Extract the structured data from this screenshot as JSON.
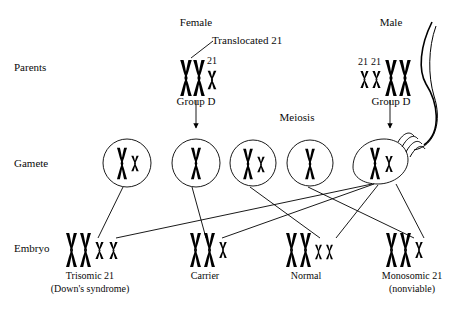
{
  "diagram": {
    "ink_color": "#000000",
    "background": "#ffffff",
    "row_labels": [
      {
        "name": "parents",
        "text": "Parents"
      },
      {
        "name": "gamete",
        "text": "Gamete"
      },
      {
        "name": "embryo",
        "text": "Embryo"
      }
    ],
    "parents": {
      "female": {
        "header": "Female",
        "annotation": "Translocated 21",
        "chromosome_21_label": "21",
        "group_label": "Group D",
        "chromosomes": [
          {
            "type": "large",
            "label": ""
          },
          {
            "type": "large",
            "label": ""
          },
          {
            "type": "small",
            "label": "21"
          }
        ]
      },
      "male": {
        "header": "Male",
        "chromosome_21_labels": [
          "21",
          "21"
        ],
        "group_label": "Group D",
        "chromosomes": [
          {
            "type": "small",
            "label": "21"
          },
          {
            "type": "small",
            "label": "21"
          },
          {
            "type": "large",
            "label": ""
          },
          {
            "type": "large",
            "label": ""
          }
        ]
      }
    },
    "meiosis_label": "Meiosis",
    "gametes": [
      {
        "name": "gamete-1",
        "shape": "circle",
        "contents": [
          "large",
          "small"
        ]
      },
      {
        "name": "gamete-2",
        "shape": "circle",
        "contents": [
          "large"
        ]
      },
      {
        "name": "gamete-3",
        "shape": "circle",
        "contents": [
          "large",
          "small"
        ]
      },
      {
        "name": "gamete-4",
        "shape": "circle",
        "contents": [
          "large"
        ]
      },
      {
        "name": "sperm",
        "shape": "sperm",
        "contents": [
          "large",
          "small"
        ]
      }
    ],
    "embryos": [
      {
        "name": "embryo-trisomic",
        "caption_line1": "Trisomic 21",
        "caption_line2": "(Down's syndrome)",
        "contents": [
          "large",
          "large",
          "small",
          "small"
        ]
      },
      {
        "name": "embryo-carrier",
        "caption_line1": "Carrier",
        "caption_line2": "",
        "contents": [
          "large",
          "large",
          "small"
        ]
      },
      {
        "name": "embryo-normal",
        "caption_line1": "Normal",
        "caption_line2": "",
        "contents": [
          "large",
          "large",
          "small",
          "small"
        ]
      },
      {
        "name": "embryo-monosomic",
        "caption_line1": "Monosomic 21",
        "caption_line2": "(nonviable)",
        "contents": [
          "large",
          "large",
          "small"
        ]
      }
    ]
  }
}
